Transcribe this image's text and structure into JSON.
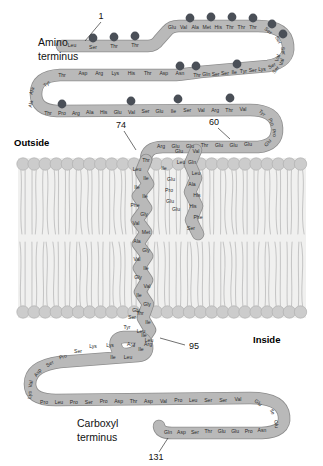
{
  "labels": {
    "amino_terminus_line1": "Amino",
    "amino_terminus_line2": "terminus",
    "carboxyl_terminus_line1": "Carboxyl",
    "carboxyl_terminus_line2": "terminus",
    "outside": "Outside",
    "inside": "Inside",
    "num_1": "1",
    "num_60": "60",
    "num_74": "74",
    "num_95": "95",
    "num_131": "131"
  },
  "colors": {
    "chain_fill": "#b9b9b9",
    "chain_stroke": "#8d8d8d",
    "phosphate": "#4a4f57",
    "lipid_head": "#cccccc",
    "lipid_head_stroke": "#b0b0b0",
    "lipid_tail": "#c6c6c6",
    "membrane_bg": "#f0f0ef",
    "residue_text": "#2b2b2b"
  },
  "chart_data": {
    "type": "diagram",
    "total_residues": 131,
    "numbered_positions": [
      1,
      60,
      74,
      95,
      131
    ],
    "regions": [
      {
        "name": "extracellular-domain",
        "start": 1,
        "end": 73,
        "side": "Outside"
      },
      {
        "name": "transmembrane-domain",
        "start": 74,
        "end": 95,
        "side": "Membrane"
      },
      {
        "name": "cytoplasmic-domain",
        "start": 96,
        "end": 131,
        "side": "Inside"
      }
    ],
    "row1": [
      "Leu",
      "Ser",
      "Thr",
      "Thr",
      "Glu",
      "Val",
      "Ala",
      "Met",
      "His",
      "Thr",
      "Thr",
      "Thr",
      "Ser",
      "Ser",
      "Ser",
      "Val",
      "Ser"
    ],
    "row2": [
      "Tyr",
      "Thr",
      "Asp",
      "Arg",
      "Lys",
      "His",
      "Thr",
      "Asp",
      "Asn",
      "Thr",
      "Gln",
      "Ser",
      "Ser",
      "Ile",
      "Tyr",
      "Ser",
      "Lys",
      "Ser",
      "Val"
    ],
    "row3": [
      "Ala",
      "Ala",
      "Thr",
      "Pro",
      "Arg",
      "Ala",
      "His",
      "Glu",
      "Val",
      "Ser",
      "Glu",
      "Ile",
      "Ser",
      "Val",
      "Arg",
      "Thr",
      "Val",
      "Tyr",
      "Pro",
      "Pro",
      "Glu"
    ],
    "row4": [
      "Arg",
      "Glu",
      "Glu",
      "Thr",
      "Glu",
      "Glu",
      "Glu"
    ],
    "tm_left": [
      "Thr",
      "Leu",
      "Ile",
      "Ile",
      "Ile",
      "Phe",
      "Gly",
      "Val",
      "Met",
      "Ala",
      "Gly",
      "Val",
      "Ile",
      "Gly",
      "Val",
      "Ile",
      "Gly",
      "Thr",
      "Ile",
      "Leu",
      "Leu",
      "Ile",
      "Ser",
      "Tyr",
      "Gly",
      "Ile"
    ],
    "tm_right": [
      "Val",
      "Gln",
      "Leu",
      "Ala",
      "His",
      "His",
      "Phe",
      "Ser",
      "Glu",
      "Pro",
      "Glu",
      "Glu",
      "Leu",
      "Ile",
      "Glu"
    ],
    "cyto_row1": [
      "Arg",
      "Arg",
      "Leu",
      "Ile",
      "Lys",
      "Lys",
      "Ser",
      "Pro",
      "Ser",
      "Asp",
      "Val",
      "Lys"
    ],
    "cyto_row2": [
      "Pro",
      "Leu",
      "Pro",
      "Ser",
      "Pro",
      "Asp",
      "Thr",
      "Asp",
      "Val",
      "Pro",
      "Leu",
      "Ser",
      "Ser",
      "Val",
      "Glu",
      "Ile",
      "Glu"
    ],
    "cyto_row3": [
      "Gln",
      "Asp",
      "Ser",
      "Thr",
      "Glu",
      "Glu",
      "Pro",
      "Asn"
    ],
    "phosphosites_count": 16
  }
}
